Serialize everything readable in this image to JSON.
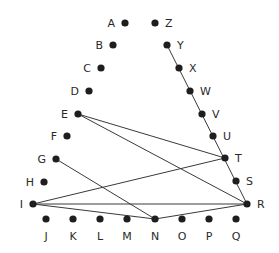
{
  "diagram": {
    "nodes": [
      {
        "id": "A",
        "x": 125,
        "y": 23,
        "label_side": "left"
      },
      {
        "id": "B",
        "x": 113,
        "y": 45,
        "label_side": "left"
      },
      {
        "id": "C",
        "x": 101,
        "y": 68,
        "label_side": "left"
      },
      {
        "id": "D",
        "x": 89,
        "y": 91,
        "label_side": "left"
      },
      {
        "id": "E",
        "x": 78,
        "y": 114,
        "label_side": "left"
      },
      {
        "id": "F",
        "x": 67,
        "y": 136,
        "label_side": "left"
      },
      {
        "id": "G",
        "x": 56,
        "y": 159,
        "label_side": "left"
      },
      {
        "id": "H",
        "x": 44,
        "y": 182,
        "label_side": "left"
      },
      {
        "id": "I",
        "x": 33,
        "y": 204,
        "label_side": "left"
      },
      {
        "id": "J",
        "x": 46,
        "y": 219,
        "label_side": "below"
      },
      {
        "id": "K",
        "x": 73,
        "y": 219,
        "label_side": "below"
      },
      {
        "id": "L",
        "x": 100,
        "y": 219,
        "label_side": "below"
      },
      {
        "id": "M",
        "x": 127,
        "y": 219,
        "label_side": "below"
      },
      {
        "id": "N",
        "x": 155,
        "y": 219,
        "label_side": "below"
      },
      {
        "id": "O",
        "x": 182,
        "y": 219,
        "label_side": "below"
      },
      {
        "id": "P",
        "x": 209,
        "y": 219,
        "label_side": "below"
      },
      {
        "id": "Q",
        "x": 236,
        "y": 219,
        "label_side": "below"
      },
      {
        "id": "R",
        "x": 247,
        "y": 204,
        "label_side": "right"
      },
      {
        "id": "S",
        "x": 236,
        "y": 181,
        "label_side": "right"
      },
      {
        "id": "T",
        "x": 225,
        "y": 158,
        "label_side": "right"
      },
      {
        "id": "U",
        "x": 213,
        "y": 136,
        "label_side": "right"
      },
      {
        "id": "V",
        "x": 202,
        "y": 114,
        "label_side": "right"
      },
      {
        "id": "W",
        "x": 190,
        "y": 91,
        "label_side": "right"
      },
      {
        "id": "X",
        "x": 179,
        "y": 68,
        "label_side": "right"
      },
      {
        "id": "Y",
        "x": 167,
        "y": 45,
        "label_side": "right"
      },
      {
        "id": "Z",
        "x": 155,
        "y": 23,
        "label_side": "right"
      }
    ],
    "edges": [
      [
        "Y",
        "R"
      ],
      [
        "E",
        "T"
      ],
      [
        "E",
        "R"
      ],
      [
        "G",
        "N"
      ],
      [
        "I",
        "T"
      ],
      [
        "I",
        "R"
      ],
      [
        "I",
        "N"
      ],
      [
        "N",
        "R"
      ]
    ],
    "colors": {
      "dot": "#1e1e1e",
      "edge": "#3a3a3a",
      "label": "#2a2a2a",
      "background": "#ffffff"
    }
  }
}
